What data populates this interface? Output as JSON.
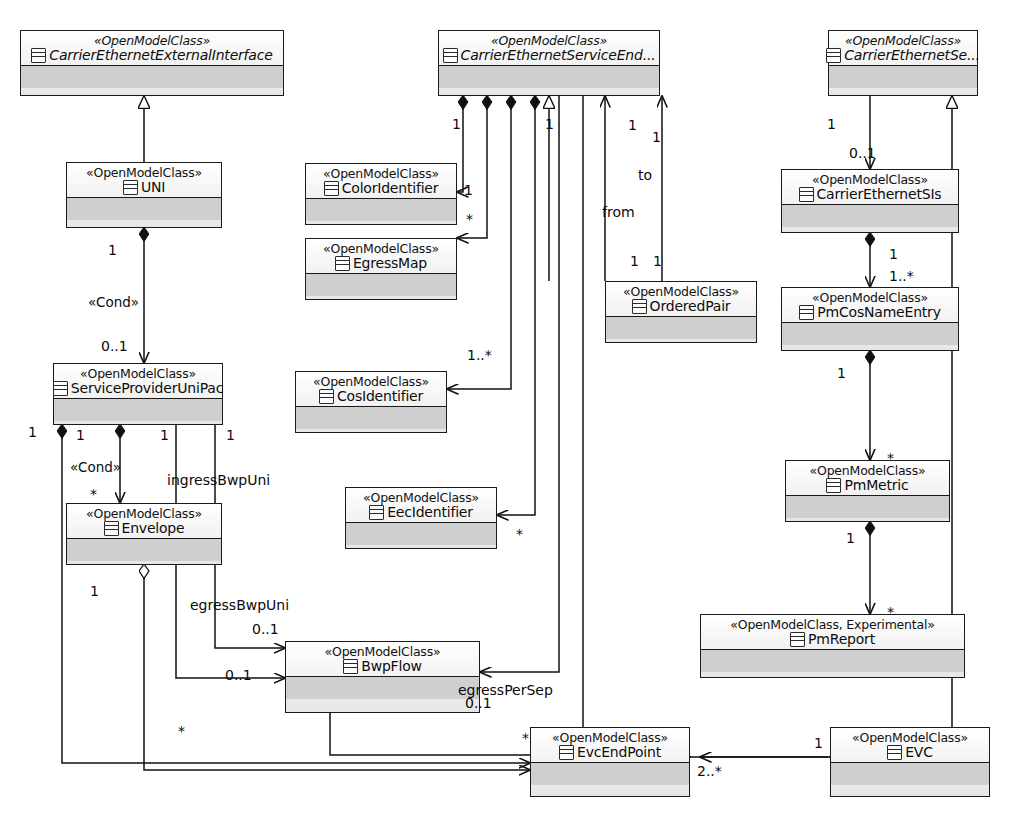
{
  "diagram": {
    "type": "uml-class-diagram",
    "default_stereotype": "«OpenModelClass»",
    "class_icon": "class-icon"
  },
  "classes": [
    {
      "id": "ceei",
      "stereotype": "«OpenModelClass»",
      "name": "CarrierEthernetExternalInterface",
      "abstract": true,
      "x": 20,
      "y": 30,
      "w": 264,
      "h": 66
    },
    {
      "id": "cese",
      "stereotype": "«OpenModelClass»",
      "name": "CarrierEthernetServiceEnd...",
      "abstract": true,
      "x": 438,
      "y": 30,
      "w": 222,
      "h": 66
    },
    {
      "id": "cesi",
      "stereotype": "«OpenModelClass»",
      "name": "CarrierEthernetSe...",
      "abstract": true,
      "x": 828,
      "y": 30,
      "w": 150,
      "h": 66
    },
    {
      "id": "uni",
      "stereotype": "«OpenModelClass»",
      "name": "UNI",
      "abstract": false,
      "x": 66,
      "y": 162,
      "w": 156,
      "h": 66
    },
    {
      "id": "color",
      "stereotype": "«OpenModelClass»",
      "name": "ColorIdentifier",
      "abstract": false,
      "x": 305,
      "y": 163,
      "w": 152,
      "h": 62
    },
    {
      "id": "egmap",
      "stereotype": "«OpenModelClass»",
      "name": "EgressMap",
      "abstract": false,
      "x": 305,
      "y": 238,
      "w": 152,
      "h": 62
    },
    {
      "id": "cesis",
      "stereotype": "«OpenModelClass»",
      "name": "CarrierEthernetSIs",
      "abstract": false,
      "x": 781,
      "y": 169,
      "w": 178,
      "h": 64
    },
    {
      "id": "opair",
      "stereotype": "«OpenModelClass»",
      "name": "OrderedPair",
      "abstract": false,
      "x": 605,
      "y": 281,
      "w": 152,
      "h": 62
    },
    {
      "id": "pmcos",
      "stereotype": "«OpenModelClass»",
      "name": "PmCosNameEntry",
      "abstract": false,
      "x": 781,
      "y": 287,
      "w": 178,
      "h": 64
    },
    {
      "id": "spup",
      "stereotype": "«OpenModelClass»",
      "name": "ServiceProviderUniPac",
      "abstract": false,
      "x": 53,
      "y": 363,
      "w": 170,
      "h": 62
    },
    {
      "id": "cosid",
      "stereotype": "«OpenModelClass»",
      "name": "CosIdentifier",
      "abstract": false,
      "x": 295,
      "y": 371,
      "w": 152,
      "h": 62
    },
    {
      "id": "pmmet",
      "stereotype": "«OpenModelClass»",
      "name": "PmMetric",
      "abstract": false,
      "x": 785,
      "y": 460,
      "w": 165,
      "h": 62
    },
    {
      "id": "eecid",
      "stereotype": "«OpenModelClass»",
      "name": "EecIdentifier",
      "abstract": false,
      "x": 345,
      "y": 487,
      "w": 152,
      "h": 62
    },
    {
      "id": "env",
      "stereotype": "«OpenModelClass»",
      "name": "Envelope",
      "abstract": false,
      "x": 66,
      "y": 503,
      "w": 156,
      "h": 62
    },
    {
      "id": "pmrep",
      "stereotype": "«OpenModelClass, Experimental»",
      "name": "PmReport",
      "abstract": false,
      "x": 700,
      "y": 614,
      "w": 265,
      "h": 64
    },
    {
      "id": "bwp",
      "stereotype": "«OpenModelClass»",
      "name": "BwpFlow",
      "abstract": false,
      "x": 285,
      "y": 641,
      "w": 195,
      "h": 72
    },
    {
      "id": "evcep",
      "stereotype": "«OpenModelClass»",
      "name": "EvcEndPoint",
      "abstract": false,
      "x": 530,
      "y": 727,
      "w": 160,
      "h": 70
    },
    {
      "id": "evc",
      "stereotype": "«OpenModelClass»",
      "name": "EVC",
      "abstract": false,
      "x": 830,
      "y": 727,
      "w": 160,
      "h": 70
    }
  ],
  "labels": [
    {
      "id": "l1",
      "text": "1",
      "x": 108,
      "y": 243,
      "kind": "mult"
    },
    {
      "id": "l2",
      "text": "«Cond»",
      "x": 88,
      "y": 296,
      "kind": "stereo"
    },
    {
      "id": "l3",
      "text": "0..1",
      "x": 101,
      "y": 339,
      "kind": "mult"
    },
    {
      "id": "m1",
      "text": "1",
      "x": 452,
      "y": 117,
      "kind": "mult"
    },
    {
      "id": "m2",
      "text": "1",
      "x": 545,
      "y": 117,
      "kind": "mult"
    },
    {
      "id": "m3",
      "text": "1",
      "x": 628,
      "y": 118,
      "kind": "mult"
    },
    {
      "id": "m4",
      "text": "1",
      "x": 652,
      "y": 130,
      "kind": "mult"
    },
    {
      "id": "c1",
      "text": "1",
      "x": 464,
      "y": 183,
      "kind": "mult"
    },
    {
      "id": "c2",
      "text": "*",
      "x": 466,
      "y": 212,
      "kind": "mult"
    },
    {
      "id": "c3",
      "text": "1..*",
      "x": 467,
      "y": 348,
      "kind": "mult"
    },
    {
      "id": "c4",
      "text": "*",
      "x": 516,
      "y": 527,
      "kind": "mult"
    },
    {
      "id": "t1",
      "text": "to",
      "x": 638,
      "y": 168,
      "kind": "role"
    },
    {
      "id": "t2",
      "text": "from",
      "x": 602,
      "y": 205,
      "kind": "role"
    },
    {
      "id": "t3",
      "text": "1",
      "x": 630,
      "y": 254,
      "kind": "mult"
    },
    {
      "id": "t4",
      "text": "1",
      "x": 653,
      "y": 254,
      "kind": "mult"
    },
    {
      "id": "r1",
      "text": "1",
      "x": 827,
      "y": 117,
      "kind": "mult"
    },
    {
      "id": "r2",
      "text": "0..1",
      "x": 849,
      "y": 146,
      "kind": "mult"
    },
    {
      "id": "r3",
      "text": "1",
      "x": 889,
      "y": 247,
      "kind": "mult"
    },
    {
      "id": "r4",
      "text": "1..*",
      "x": 889,
      "y": 269,
      "kind": "mult"
    },
    {
      "id": "r5",
      "text": "1",
      "x": 837,
      "y": 366,
      "kind": "mult"
    },
    {
      "id": "r6",
      "text": "*",
      "x": 887,
      "y": 451,
      "kind": "mult"
    },
    {
      "id": "r7",
      "text": "1",
      "x": 846,
      "y": 531,
      "kind": "mult"
    },
    {
      "id": "r8",
      "text": "*",
      "x": 887,
      "y": 605,
      "kind": "mult"
    },
    {
      "id": "s1",
      "text": "1",
      "x": 28,
      "y": 425,
      "kind": "mult"
    },
    {
      "id": "s2",
      "text": "1",
      "x": 76,
      "y": 428,
      "kind": "mult"
    },
    {
      "id": "s3",
      "text": "1",
      "x": 160,
      "y": 428,
      "kind": "mult"
    },
    {
      "id": "s4",
      "text": "1",
      "x": 226,
      "y": 428,
      "kind": "mult"
    },
    {
      "id": "s5",
      "text": "«Cond»",
      "x": 70,
      "y": 461,
      "kind": "stereo"
    },
    {
      "id": "s6",
      "text": "*",
      "x": 90,
      "y": 487,
      "kind": "mult"
    },
    {
      "id": "s7",
      "text": "ingressBwpUni",
      "x": 167,
      "y": 473,
      "kind": "role"
    },
    {
      "id": "s8",
      "text": "1",
      "x": 90,
      "y": 584,
      "kind": "mult"
    },
    {
      "id": "s9",
      "text": "egressBwpUni",
      "x": 190,
      "y": 598,
      "kind": "role"
    },
    {
      "id": "s10",
      "text": "0..1",
      "x": 252,
      "y": 622,
      "kind": "mult"
    },
    {
      "id": "s11",
      "text": "0..1",
      "x": 225,
      "y": 668,
      "kind": "mult"
    },
    {
      "id": "s12",
      "text": "egressPerSep",
      "x": 458,
      "y": 683,
      "kind": "role"
    },
    {
      "id": "s13",
      "text": "0..1",
      "x": 465,
      "y": 696,
      "kind": "mult"
    },
    {
      "id": "s14",
      "text": "*",
      "x": 178,
      "y": 724,
      "kind": "mult"
    },
    {
      "id": "s15",
      "text": "*",
      "x": 522,
      "y": 731,
      "kind": "mult"
    },
    {
      "id": "s16",
      "text": "2..*",
      "x": 697,
      "y": 764,
      "kind": "mult"
    },
    {
      "id": "s17",
      "text": "1",
      "x": 814,
      "y": 736,
      "kind": "mult"
    }
  ]
}
